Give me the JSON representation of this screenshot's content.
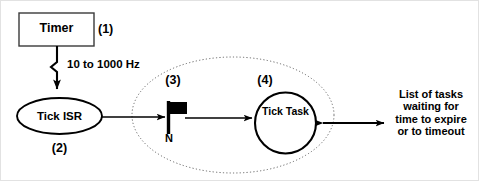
{
  "diagram": {
    "stroke_color": "#000000",
    "background_color": "#ffffff",
    "nodes": {
      "timer": {
        "label": "Timer",
        "shape": "rectangle",
        "reference": "(1)"
      },
      "tick_isr": {
        "label": "Tick ISR",
        "shape": "ellipse",
        "reference": "(2)"
      },
      "semaphore_flag": {
        "label": "N",
        "shape": "flag",
        "reference": "(3)"
      },
      "tick_task": {
        "label_line1": "Tick",
        "label_line2": "Task",
        "shape": "circle",
        "reference": "(4)"
      }
    },
    "edges": {
      "timer_to_tick_isr": {
        "label": "10 to 1000 Hz",
        "style": "lightning-arrow",
        "direction": "down"
      },
      "tick_isr_to_flag": {
        "label": "",
        "style": "solid-arrow",
        "direction": "right"
      },
      "flag_to_tick_task": {
        "label": "",
        "style": "solid-arrow",
        "direction": "right"
      },
      "tick_task_to_task_list": {
        "label": "",
        "style": "solid-double-arrow",
        "direction": "both"
      }
    },
    "grouping_boundary": {
      "style": "dotted-ellipse"
    },
    "task_list_note": {
      "lines": [
        "List of tasks",
        "waiting for",
        "time to expire",
        "or to timeout"
      ]
    }
  }
}
